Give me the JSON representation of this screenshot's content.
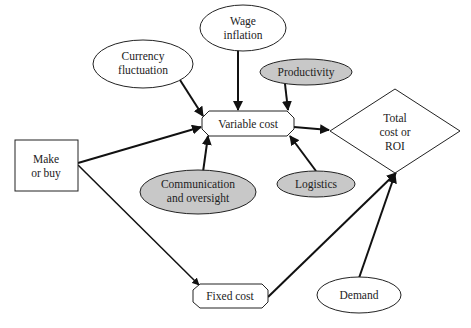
{
  "colors": {
    "white_fill": "#ffffff",
    "gray_fill": "#c8c8c8",
    "stroke": "#222222"
  },
  "nodes": {
    "make_or_buy": {
      "lines": [
        "Make",
        "or buy"
      ],
      "shape": "rectangle"
    },
    "currency": {
      "lines": [
        "Currency",
        "fluctuation"
      ],
      "shape": "ellipse",
      "fill": "white"
    },
    "wage": {
      "lines": [
        "Wage",
        "inflation"
      ],
      "shape": "ellipse",
      "fill": "white"
    },
    "productivity": {
      "lines": [
        "Productivity"
      ],
      "shape": "ellipse",
      "fill": "gray"
    },
    "variable_cost": {
      "lines": [
        "Variable cost"
      ],
      "shape": "octagon-box"
    },
    "communication": {
      "lines": [
        "Communication",
        "and oversight"
      ],
      "shape": "ellipse",
      "fill": "gray"
    },
    "logistics": {
      "lines": [
        "Logistics"
      ],
      "shape": "ellipse",
      "fill": "gray"
    },
    "total_cost": {
      "lines": [
        "Total",
        "cost or",
        "ROI"
      ],
      "shape": "diamond"
    },
    "fixed_cost": {
      "lines": [
        "Fixed cost"
      ],
      "shape": "octagon-box"
    },
    "demand": {
      "lines": [
        "Demand"
      ],
      "shape": "ellipse",
      "fill": "white"
    }
  },
  "edges": [
    {
      "from": "make_or_buy",
      "to": "variable_cost"
    },
    {
      "from": "make_or_buy",
      "to": "fixed_cost"
    },
    {
      "from": "currency",
      "to": "variable_cost"
    },
    {
      "from": "wage",
      "to": "variable_cost"
    },
    {
      "from": "productivity",
      "to": "variable_cost"
    },
    {
      "from": "communication",
      "to": "variable_cost"
    },
    {
      "from": "logistics",
      "to": "variable_cost"
    },
    {
      "from": "variable_cost",
      "to": "total_cost"
    },
    {
      "from": "fixed_cost",
      "to": "total_cost"
    },
    {
      "from": "demand",
      "to": "total_cost"
    }
  ]
}
